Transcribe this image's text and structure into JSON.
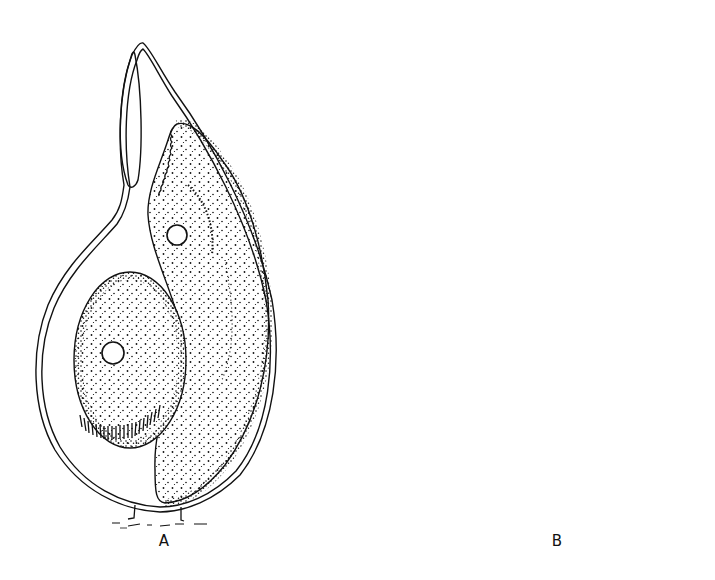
{
  "figure": {
    "type": "scientific illustration",
    "style": "black ink stipple line drawing on white",
    "panels": [
      {
        "id": "A",
        "label": "A",
        "description": "Flask-shaped lorica with narrow neck containing an elongated stippled cell with a nucleus and a rounded ciliated cell with a nucleus; attached at base by a short stalk"
      },
      {
        "id": "B",
        "label": "B",
        "description": "Flask-shaped lorica with a swollen base; an upper ciliated cell emerging through the neck and a lower spindle-shaped stippled cell with a nucleus; attached at base by a short stalk"
      }
    ]
  },
  "colors": {
    "ink": "#111111",
    "background": "#ffffff"
  }
}
